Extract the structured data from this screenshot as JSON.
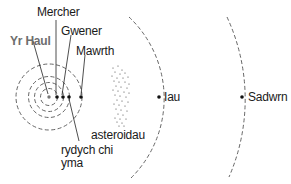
{
  "diagram": {
    "title": "",
    "colors": {
      "orbit": "#555555",
      "planet": "#111111",
      "sun": "#777777",
      "sun_label": "#6d6d6d",
      "text": "#1a1a1a"
    },
    "sun": {
      "label": "Yr Haul"
    },
    "planets": [
      {
        "id": "mercher",
        "label": "Mercher"
      },
      {
        "id": "gwener",
        "label": "Gwener"
      },
      {
        "id": "earth",
        "label": "rydych chi\nyma"
      },
      {
        "id": "mawrth",
        "label": "Mawrth"
      },
      {
        "id": "iau",
        "label": "Iau"
      },
      {
        "id": "sadwrn",
        "label": "Sadwrn"
      }
    ],
    "asteroid_belt": {
      "label": "asteroidau"
    }
  }
}
